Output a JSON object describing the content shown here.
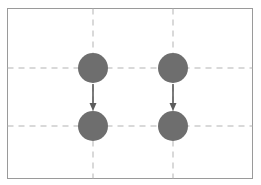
{
  "figure": {
    "canvas": {
      "width": 261,
      "height": 185,
      "background_color": "#ffffff"
    },
    "frame": {
      "name": "diagram-border",
      "x": 7.5,
      "y": 8.5,
      "width": 245,
      "height": 170,
      "stroke_color": "#9a9a9a",
      "stroke_width": 1,
      "fill": "none"
    },
    "grid": {
      "line_color": "#b3b3b3",
      "line_width": 1,
      "dash_pattern": "6 5",
      "horizontal_lines": [
        {
          "name": "grid-line-horizontal-top",
          "y": 68,
          "x1": 7.5,
          "x2": 252.5
        },
        {
          "name": "grid-line-horizontal-bottom",
          "y": 126,
          "x1": 7.5,
          "x2": 252.5
        }
      ],
      "vertical_lines": [
        {
          "name": "grid-line-vertical-left",
          "x": 93,
          "y1": 8.5,
          "y2": 178.5
        },
        {
          "name": "grid-line-vertical-right",
          "x": 173,
          "y1": 8.5,
          "y2": 178.5
        }
      ]
    },
    "circles": [
      {
        "name": "circle-top-left",
        "cx": 93,
        "cy": 68,
        "r": 15,
        "fill": "#6e6e6e"
      },
      {
        "name": "circle-top-right",
        "cx": 173,
        "cy": 68,
        "r": 15,
        "fill": "#6e6e6e"
      },
      {
        "name": "circle-bottom-left",
        "cx": 93,
        "cy": 126,
        "r": 15,
        "fill": "#6e6e6e"
      },
      {
        "name": "circle-bottom-right",
        "cx": 173,
        "cy": 126,
        "r": 15,
        "fill": "#6e6e6e"
      }
    ],
    "arrows": [
      {
        "name": "arrow-left-downward",
        "x": 93,
        "y_start": 84,
        "y_end": 111,
        "stroke_color": "#5c5c5c",
        "stroke_width": 1.6,
        "head_width": 7,
        "head_length": 8,
        "direction": "down"
      },
      {
        "name": "arrow-right-downward",
        "x": 173,
        "y_start": 84,
        "y_end": 111,
        "stroke_color": "#5c5c5c",
        "stroke_width": 1.6,
        "head_width": 7,
        "head_length": 8,
        "direction": "down"
      }
    ]
  }
}
